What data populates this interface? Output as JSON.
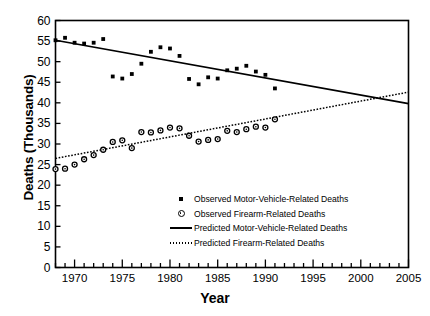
{
  "chart_data": {
    "type": "scatter",
    "title": "",
    "xlabel": "Year",
    "ylabel": "Deaths (Thousands)",
    "xlim": [
      1968,
      2005
    ],
    "ylim": [
      0,
      60
    ],
    "grid": false,
    "legend_position": "inside-lower-center",
    "x_major_ticks": [
      1970,
      1975,
      1980,
      1985,
      1990,
      1995,
      2000,
      2005
    ],
    "x_minor_tick_step": 1,
    "y_ticks": [
      0,
      5,
      10,
      15,
      20,
      25,
      30,
      35,
      40,
      45,
      50,
      55,
      60
    ],
    "series": [
      {
        "name": "Observed Motor-Vehicle-Related Deaths",
        "marker": "filled-square",
        "type": "scatter",
        "points": [
          [
            1968,
            55.2
          ],
          [
            1969,
            55.8
          ],
          [
            1970,
            54.6
          ],
          [
            1971,
            54.4
          ],
          [
            1972,
            54.6
          ],
          [
            1973,
            55.5
          ],
          [
            1974,
            46.4
          ],
          [
            1975,
            45.9
          ],
          [
            1976,
            47.0
          ],
          [
            1977,
            49.5
          ],
          [
            1978,
            52.4
          ],
          [
            1979,
            53.5
          ],
          [
            1980,
            53.2
          ],
          [
            1981,
            51.4
          ],
          [
            1982,
            45.8
          ],
          [
            1983,
            44.5
          ],
          [
            1984,
            46.2
          ],
          [
            1985,
            45.9
          ],
          [
            1986,
            47.9
          ],
          [
            1987,
            48.3
          ],
          [
            1988,
            49.0
          ],
          [
            1989,
            47.6
          ],
          [
            1990,
            46.8
          ],
          [
            1991,
            43.5
          ]
        ]
      },
      {
        "name": "Observed Firearm-Related Deaths",
        "marker": "open-circle",
        "type": "scatter",
        "points": [
          [
            1968,
            23.9
          ],
          [
            1969,
            24.0
          ],
          [
            1970,
            25.0
          ],
          [
            1971,
            26.3
          ],
          [
            1972,
            27.3
          ],
          [
            1973,
            28.6
          ],
          [
            1974,
            30.5
          ],
          [
            1975,
            30.9
          ],
          [
            1976,
            29.0
          ],
          [
            1977,
            32.9
          ],
          [
            1978,
            32.8
          ],
          [
            1979,
            33.3
          ],
          [
            1980,
            34.0
          ],
          [
            1981,
            33.8
          ],
          [
            1982,
            32.0
          ],
          [
            1983,
            30.6
          ],
          [
            1984,
            31.0
          ],
          [
            1985,
            31.2
          ],
          [
            1986,
            33.2
          ],
          [
            1987,
            32.9
          ],
          [
            1988,
            33.6
          ],
          [
            1989,
            34.2
          ],
          [
            1990,
            34.0
          ],
          [
            1991,
            36.0
          ]
        ]
      },
      {
        "name": "Predicted Motor-Vehicle-Related Deaths",
        "type": "line",
        "style": "solid",
        "endpoints": [
          [
            1968,
            55.2
          ],
          [
            2005,
            39.8
          ]
        ]
      },
      {
        "name": "Predicted Firearm-Related Deaths",
        "type": "line",
        "style": "dotted",
        "endpoints": [
          [
            1968,
            26.5
          ],
          [
            2005,
            42.6
          ]
        ]
      }
    ],
    "annotations": [
      {
        "text": "Predicted trend lines cross near 2002-2003 at about 42 thousand deaths"
      }
    ]
  },
  "axes": {
    "y_title": "Deaths (Thousands)",
    "x_title": "Year",
    "y_tick_labels": [
      "60",
      "55",
      "50",
      "45",
      "40",
      "35",
      "30",
      "25",
      "20",
      "15",
      "10",
      "5",
      "0"
    ],
    "x_tick_labels": [
      "1970",
      "1975",
      "1980",
      "1985",
      "1990",
      "1995",
      "2000",
      "2005"
    ]
  },
  "legend": {
    "items": [
      {
        "label": "Observed Motor-Vehicle-Related Deaths",
        "marker": "filled-square"
      },
      {
        "label": "Observed Firearm-Related Deaths",
        "marker": "open-circle"
      },
      {
        "label": "Predicted Motor-Vehicle-Related Deaths",
        "marker": "solid-line"
      },
      {
        "label": "Predicted Firearm-Related Deaths",
        "marker": "dotted-line"
      }
    ]
  },
  "colors": {
    "ink": "#000000",
    "background": "#ffffff"
  }
}
